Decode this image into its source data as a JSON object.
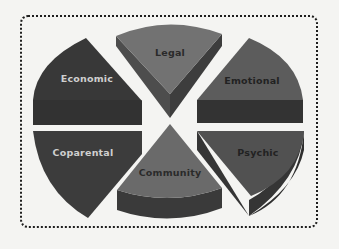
{
  "diagram": {
    "type": "segmented-3d-pie",
    "frame": {
      "style": "dotted-rounded-border",
      "color": "#1e1e1e"
    },
    "segments": [
      {
        "id": "economic",
        "label": "Economic",
        "position": "top-left",
        "fill": "#3b3b3b",
        "label_color": "#cfcfcf"
      },
      {
        "id": "legal",
        "label": "Legal",
        "position": "top-center",
        "fill": "#6e6e6e",
        "label_color": "#2a2a2a"
      },
      {
        "id": "emotional",
        "label": "Emotional",
        "position": "top-right",
        "fill": "#5a5a5a",
        "label_color": "#222222"
      },
      {
        "id": "coparental",
        "label": "Coparental",
        "position": "bottom-left",
        "fill": "#3e3e3e",
        "label_color": "#cfcfcf"
      },
      {
        "id": "community",
        "label": "Community",
        "position": "bottom-center",
        "fill": "#6b6b6b",
        "label_color": "#2a2a2a"
      },
      {
        "id": "psychic",
        "label": "Psychic",
        "position": "bottom-right",
        "fill": "#4e4e4e",
        "label_color": "#222222"
      }
    ]
  }
}
